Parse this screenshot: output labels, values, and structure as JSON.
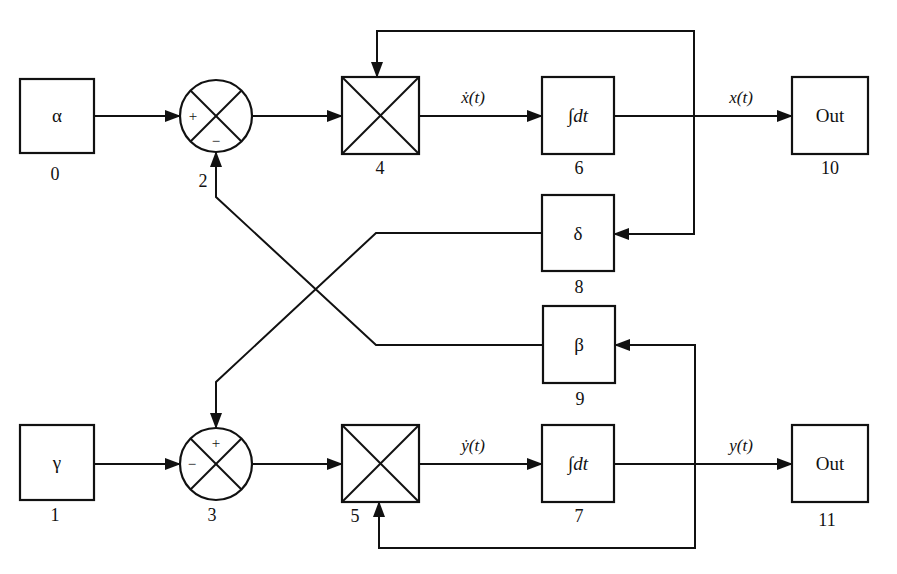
{
  "diagram": {
    "type": "block-diagram",
    "blocks": {
      "b0": {
        "id": "0",
        "label": "α",
        "kind": "constant"
      },
      "b1": {
        "id": "1",
        "label": "γ",
        "kind": "constant"
      },
      "b2": {
        "id": "2",
        "label": "",
        "kind": "summing-junction",
        "signs": {
          "left": "+",
          "bottom": "−"
        }
      },
      "b3": {
        "id": "3",
        "label": "",
        "kind": "summing-junction",
        "signs": {
          "top": "+",
          "left": "−"
        }
      },
      "b4": {
        "id": "4",
        "label": "",
        "kind": "multiplier"
      },
      "b5": {
        "id": "5",
        "label": "",
        "kind": "multiplier"
      },
      "b6": {
        "id": "6",
        "label": "∫dt",
        "kind": "integrator"
      },
      "b7": {
        "id": "7",
        "label": "∫dt",
        "kind": "integrator"
      },
      "b8": {
        "id": "8",
        "label": "δ",
        "kind": "gain"
      },
      "b9": {
        "id": "9",
        "label": "β",
        "kind": "gain"
      },
      "b10": {
        "id": "10",
        "label": "Out",
        "kind": "output"
      },
      "b11": {
        "id": "11",
        "label": "Out",
        "kind": "output"
      }
    },
    "signals": {
      "xdot": "ẋ(t)",
      "x": "x(t)",
      "ydot": "ẏ(t)",
      "y": "y(t)"
    },
    "connections": [
      {
        "from": "0",
        "to": "2",
        "port": "+"
      },
      {
        "from": "2",
        "to": "4"
      },
      {
        "from": "4",
        "to": "6",
        "signal": "ẋ(t)"
      },
      {
        "from": "6",
        "to": "10",
        "signal": "x(t)"
      },
      {
        "from": "6",
        "to": "4",
        "note": "feedback x(t)"
      },
      {
        "from": "6",
        "to": "8",
        "note": "feedback x(t)"
      },
      {
        "from": "8",
        "to": "3",
        "port": "+"
      },
      {
        "from": "1",
        "to": "3",
        "port": "−"
      },
      {
        "from": "3",
        "to": "5"
      },
      {
        "from": "5",
        "to": "7",
        "signal": "ẏ(t)"
      },
      {
        "from": "7",
        "to": "11",
        "signal": "y(t)"
      },
      {
        "from": "7",
        "to": "5",
        "note": "feedback y(t)"
      },
      {
        "from": "7",
        "to": "9",
        "note": "feedback y(t)"
      },
      {
        "from": "9",
        "to": "2",
        "port": "−"
      }
    ]
  }
}
